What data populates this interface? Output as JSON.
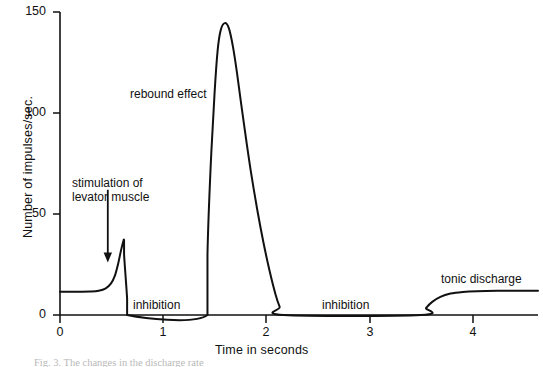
{
  "chart_data": {
    "type": "line",
    "title": "",
    "xlabel": "Time in seconds",
    "ylabel": "Number of impulses/sec.",
    "xlim": [
      0,
      4.7
    ],
    "ylim": [
      0,
      150
    ],
    "xticks": [
      0,
      1,
      2,
      3,
      4
    ],
    "xtick_labels": [
      "0",
      "1",
      "2",
      "3",
      "4"
    ],
    "yticks": [
      0,
      50,
      100,
      150
    ],
    "ytick_labels": [
      "0",
      "50",
      "100",
      "150"
    ],
    "grid": false,
    "legend": "none",
    "series": [
      {
        "name": "impulse frequency",
        "x": [
          0.0,
          0.1,
          0.2,
          0.3,
          0.38,
          0.45,
          0.5,
          0.54,
          0.57,
          0.6,
          0.62,
          0.63,
          0.63,
          0.66,
          0.66,
          1.45,
          1.45,
          1.48,
          1.52,
          1.55,
          1.58,
          1.62,
          1.66,
          1.7,
          1.74,
          1.78,
          1.83,
          1.88,
          1.94,
          2.0,
          2.06,
          2.12,
          2.16,
          2.2,
          3.55,
          3.6,
          3.66,
          3.74,
          3.84,
          3.96,
          4.1,
          4.3,
          4.5,
          4.7
        ],
        "y": [
          11.5,
          11.5,
          11.5,
          11.6,
          12.0,
          13.2,
          15.5,
          19.5,
          25.0,
          32.0,
          36.0,
          37.0,
          30.0,
          8.0,
          0.0,
          0.0,
          30.0,
          72.0,
          110.0,
          131.0,
          141.0,
          144.5,
          142.0,
          133.0,
          120.0,
          105.0,
          87.0,
          70.0,
          52.0,
          36.0,
          22.0,
          10.0,
          4.0,
          0.0,
          0.0,
          3.5,
          6.5,
          9.0,
          10.6,
          11.4,
          11.8,
          12.0,
          12.0,
          12.0
        ]
      }
    ],
    "annotations": [
      {
        "name": "stimulation",
        "text_line_1": "stimulation of",
        "text_line_2": "levator muscle",
        "arrow": "down-arrow",
        "x": 0.47,
        "y_from": 62,
        "y_to": 26
      },
      {
        "name": "rebound",
        "text": "rebound effect",
        "x": 1.0,
        "y": 107
      },
      {
        "name": "inhibition-1",
        "text": "inhibition",
        "x": 0.95,
        "y": 8
      },
      {
        "name": "inhibition-2",
        "text": "inhibition",
        "x": 2.8,
        "y": 8
      },
      {
        "name": "tonic",
        "text": "tonic discharge",
        "x": 4.0,
        "y": 22
      }
    ],
    "peaks": [
      {
        "name": "stimulation-spike",
        "x": 0.63,
        "y": 37
      },
      {
        "name": "rebound-peak",
        "x": 1.62,
        "y": 145
      }
    ],
    "baseline_level": 11.5,
    "tonic_plateau_level": 12.0,
    "line_color": "#111111",
    "axis_color": "#111111",
    "background_color": "#ffffff"
  },
  "caption": {
    "text": "Fig. 3. The changes in the discharge rate"
  }
}
